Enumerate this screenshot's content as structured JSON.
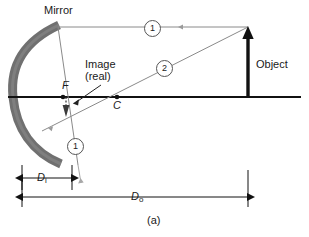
{
  "figure": {
    "caption": "(a)",
    "topic": "concave-mirror-ray-diagram"
  },
  "labels": {
    "mirror": "Mirror",
    "image_line1": "Image",
    "image_line2": "(real)",
    "focal_point": "F",
    "center_of_curvature": "C",
    "object": "Object",
    "ray_one_top": "1",
    "ray_one_bottom": "1",
    "ray_two": "2",
    "image_distance_symbol": "D",
    "image_distance_subscript": "i",
    "object_distance_symbol": "D",
    "object_distance_subscript": "o"
  },
  "colors": {
    "mirror_gray": "#707070",
    "ray_gray": "#8a8a8a",
    "axis_black": "#111111",
    "object_black": "#111111",
    "text_black": "#1a1a1a"
  },
  "geometry": {
    "axis_y": 97,
    "axis_x_start": 8,
    "axis_x_end": 301,
    "object_x": 248,
    "object_top_y": 32,
    "focal_point_x": 63,
    "center_x": 117,
    "mirror_vertex_x": 14,
    "ray1_hit_x": 58,
    "ray1_hit_y": 27,
    "ray2_hit_x": 42,
    "ray2_hit_y": 130,
    "image_x": 66,
    "image_bottom_y": 116,
    "di_from_x": 22,
    "di_to_x": 72,
    "do_from_x": 22,
    "do_to_x": 248
  }
}
